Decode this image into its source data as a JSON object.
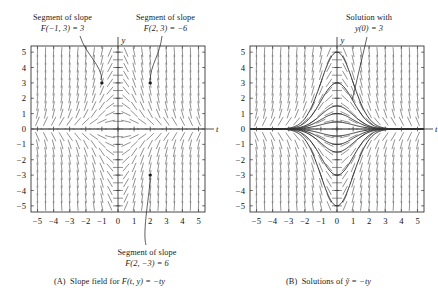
{
  "figure": {
    "panels": [
      {
        "id": "A",
        "caption_prefix": "(A)",
        "caption_text": "Slope field for",
        "caption_formula": "F(t, y) = −ty",
        "axis_x_label": "t",
        "axis_y_label": "y",
        "x_ticks": [
          "−5",
          "−4",
          "−3",
          "−2",
          "−1",
          "0",
          "1",
          "2",
          "3",
          "4",
          "5"
        ],
        "y_ticks": [
          "5",
          "4",
          "3",
          "2",
          "1",
          "0",
          "−1",
          "−2",
          "−3",
          "−4",
          "−5"
        ],
        "annotations": [
          {
            "name": "segment-slope-left",
            "lines": [
              "Segment of slope",
              "F(−1, 3) = 3"
            ],
            "point": [
              -1,
              3
            ]
          },
          {
            "name": "segment-slope-right",
            "lines": [
              "Segment of slope",
              "F(2, 3) = −6"
            ],
            "point": [
              2,
              3
            ]
          },
          {
            "name": "segment-slope-bottom",
            "lines": [
              "Segment of slope",
              "F(2, −3) = 6"
            ],
            "point": [
              2,
              -3
            ]
          }
        ]
      },
      {
        "id": "B",
        "caption_prefix": "(B)",
        "caption_text": "Solutions of",
        "caption_formula": "ỹ = −ty",
        "axis_x_label": "t",
        "axis_y_label": "y",
        "x_ticks": [
          "−5",
          "−4",
          "−3",
          "−2",
          "−1",
          "0",
          "1",
          "2",
          "3",
          "4",
          "5"
        ],
        "y_ticks": [
          "5",
          "4",
          "3",
          "2",
          "1",
          "0",
          "−1",
          "−2",
          "−3",
          "−4",
          "−5"
        ],
        "annotations": [
          {
            "name": "solution-callout",
            "lines": [
              "Solution with",
              "y(0) = 3"
            ],
            "point": [
              0.9,
              2.05
            ]
          }
        ]
      }
    ]
  },
  "chart_data": {
    "type": "line",
    "title": "",
    "subtitle": "",
    "xlabel": "t",
    "ylabel": "y",
    "xlim": [
      -5.4,
      5.4
    ],
    "ylim": [
      -5.4,
      5.4
    ],
    "grid": false,
    "legend": "none",
    "panels": [
      {
        "id": "A",
        "kind": "slope-field",
        "equation": "F(t, y) = -t*y",
        "field": {
          "t_min": -5.0,
          "t_max": 5.0,
          "t_step": 0.5,
          "y_min": -5.0,
          "y_max": 5.0,
          "y_step": 0.5,
          "segment_color": "#6e6e6e"
        },
        "marked_points": [
          {
            "t": -1,
            "y": 3,
            "slope": 3
          },
          {
            "t": 2,
            "y": 3,
            "slope": -6
          },
          {
            "t": 2,
            "y": -3,
            "slope": 6
          }
        ]
      },
      {
        "id": "B",
        "kind": "solution-curves",
        "equation": "ydot = -t*y",
        "solution_form": "y(t) = C*exp(-t^2/2)",
        "field": {
          "t_min": -5.0,
          "t_max": 5.0,
          "t_step": 0.5,
          "y_min": -5.0,
          "y_max": 5.0,
          "y_step": 0.5,
          "segment_color": "#6e6e6e"
        },
        "series": [
          {
            "name": "y(0) = 5",
            "initial_value": 5.0
          },
          {
            "name": "y(0) = 3",
            "initial_value": 3.0
          },
          {
            "name": "y(0) = 1.5",
            "initial_value": 1.5
          },
          {
            "name": "y(0) = 1",
            "initial_value": 1.0
          },
          {
            "name": "y(0) = 0.45",
            "initial_value": 0.45
          },
          {
            "name": "y(0) = -0.45",
            "initial_value": -0.45
          },
          {
            "name": "y(0) = -1",
            "initial_value": -1.0
          },
          {
            "name": "y(0) = -1.5",
            "initial_value": -1.5
          },
          {
            "name": "y(0) = -3",
            "initial_value": -3.0
          },
          {
            "name": "y(0) = -5",
            "initial_value": -5.0
          }
        ],
        "highlighted_series": "y(0) = 3"
      }
    ],
    "colors": {
      "axis": "#3a3a3a",
      "frame": "#1d1d1d",
      "slope_segment": "#6e6e6e",
      "solution_curve": "#2b2b2b",
      "text": "#111111"
    }
  }
}
